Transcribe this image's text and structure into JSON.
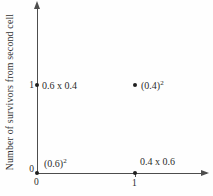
{
  "chart_data": {
    "type": "scatter",
    "title": "",
    "xlabel": "",
    "ylabel": "Number of survivors from second cell",
    "xlim": [
      0,
      1.5
    ],
    "ylim": [
      0,
      2
    ],
    "xticks": [
      "0",
      "1"
    ],
    "yticks": [
      "0",
      "1"
    ],
    "grid": false,
    "legend": false,
    "points": [
      {
        "x": 0,
        "y": 1,
        "label": "0.6 x 0.4",
        "sup": ""
      },
      {
        "x": 1,
        "y": 1,
        "label": "(0.4)",
        "sup": "2"
      },
      {
        "x": 0,
        "y": 0,
        "label": "(0.6)",
        "sup": "2"
      },
      {
        "x": 1,
        "y": 0,
        "label": "0.4 x 0.6",
        "sup": ""
      }
    ]
  },
  "colors": {
    "ink": "#2b2b2b",
    "axis": "#4d4d4d",
    "background": "#fefefe"
  }
}
